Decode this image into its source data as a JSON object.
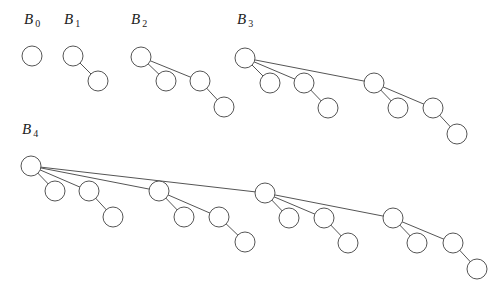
{
  "style": {
    "stroke": "#555555",
    "node_fill": "#ffffff",
    "node_radius": 10
  },
  "trees": [
    {
      "name": "B0",
      "label_main": "B",
      "label_sub": "0",
      "label_pos": [
        24,
        24
      ],
      "nodes": [
        [
          32,
          56
        ]
      ],
      "edges": []
    },
    {
      "name": "B1",
      "label_main": "B",
      "label_sub": "1",
      "label_pos": [
        64,
        24
      ],
      "nodes": [
        [
          73,
          56
        ],
        [
          98,
          81
        ]
      ],
      "edges": [
        [
          0,
          1
        ]
      ]
    },
    {
      "name": "B2",
      "label_main": "B",
      "label_sub": "2",
      "label_pos": [
        131,
        24
      ],
      "nodes": [
        [
          141,
          57
        ],
        [
          166,
          81
        ],
        [
          200,
          81
        ],
        [
          224,
          107
        ]
      ],
      "edges": [
        [
          0,
          1
        ],
        [
          0,
          2
        ],
        [
          2,
          3
        ]
      ]
    },
    {
      "name": "B3",
      "label_main": "B",
      "label_sub": "3",
      "label_pos": [
        237,
        24
      ],
      "nodes": [
        [
          245,
          58
        ],
        [
          270,
          83
        ],
        [
          304,
          83
        ],
        [
          374,
          83
        ],
        [
          328,
          108
        ],
        [
          398,
          108
        ],
        [
          433,
          108
        ],
        [
          457,
          134
        ]
      ],
      "edges": [
        [
          0,
          1
        ],
        [
          0,
          2
        ],
        [
          0,
          3
        ],
        [
          2,
          4
        ],
        [
          3,
          5
        ],
        [
          3,
          6
        ],
        [
          6,
          7
        ]
      ]
    },
    {
      "name": "B4",
      "label_main": "B",
      "label_sub": "4",
      "label_pos": [
        22,
        134
      ],
      "nodes": [
        [
          31,
          166
        ],
        [
          55,
          191
        ],
        [
          89,
          191
        ],
        [
          159,
          191
        ],
        [
          265,
          193
        ],
        [
          113,
          217
        ],
        [
          184,
          217
        ],
        [
          219,
          217
        ],
        [
          245,
          242
        ],
        [
          289,
          218
        ],
        [
          324,
          218
        ],
        [
          393,
          218
        ],
        [
          348,
          243
        ],
        [
          417,
          243
        ],
        [
          453,
          243
        ],
        [
          477,
          269
        ]
      ],
      "edges": [
        [
          0,
          1
        ],
        [
          0,
          2
        ],
        [
          0,
          3
        ],
        [
          0,
          4
        ],
        [
          2,
          5
        ],
        [
          3,
          6
        ],
        [
          3,
          7
        ],
        [
          7,
          8
        ],
        [
          4,
          9
        ],
        [
          4,
          10
        ],
        [
          4,
          11
        ],
        [
          10,
          12
        ],
        [
          11,
          13
        ],
        [
          11,
          14
        ],
        [
          14,
          15
        ]
      ]
    }
  ]
}
